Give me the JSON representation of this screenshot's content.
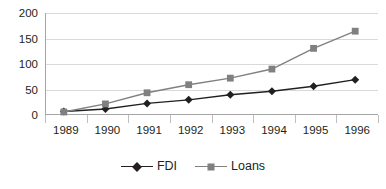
{
  "chart_data": {
    "type": "line",
    "title": "",
    "subtitle": "",
    "xlabel": "",
    "ylabel": "",
    "categories": [
      "1989",
      "1990",
      "1991",
      "1992",
      "1993",
      "1994",
      "1995",
      "1996"
    ],
    "series": [
      {
        "name": "FDI",
        "values": [
          5,
          10,
          21,
          28,
          38,
          45,
          55,
          68
        ],
        "color": "#231f20",
        "marker": "diamond"
      },
      {
        "name": "Loans",
        "values": [
          4,
          20,
          42,
          58,
          71,
          89,
          130,
          164
        ],
        "color": "#808080",
        "marker": "square"
      }
    ],
    "ylim": [
      0,
      200
    ],
    "yticks": [
      0,
      50,
      100,
      150,
      200
    ],
    "ytick_labels": [
      "0",
      "50",
      "100",
      "150",
      "200"
    ],
    "grid": true,
    "grid_color": "#d9d9d9",
    "legend_position": "bottom-center",
    "axis_color": "#a6a6a6",
    "background": "#ffffff"
  },
  "legend": {
    "entries": [
      {
        "label": "FDI"
      },
      {
        "label": "Loans"
      }
    ]
  }
}
